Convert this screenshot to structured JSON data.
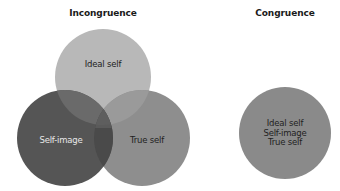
{
  "incongruence": {
    "title": "Incongruence",
    "circles": [
      {
        "id": "ideal",
        "label": "Ideal self",
        "cx": 103,
        "cy": 77,
        "r": 48,
        "color": "#b8b8b8"
      },
      {
        "id": "self_image",
        "label": "Self-image",
        "cx": 65,
        "cy": 138,
        "r": 48,
        "color": "#555555"
      },
      {
        "id": "true",
        "label": "True self",
        "cx": 142,
        "cy": 138,
        "r": 48,
        "color": "#8e8e8e"
      }
    ]
  },
  "congruence": {
    "title": "Congruence",
    "circle": {
      "cx": 285,
      "cy": 133,
      "r": 46,
      "color": "#8a8a8a"
    },
    "lines": [
      "Ideal self",
      "Self-image",
      "True self"
    ]
  }
}
